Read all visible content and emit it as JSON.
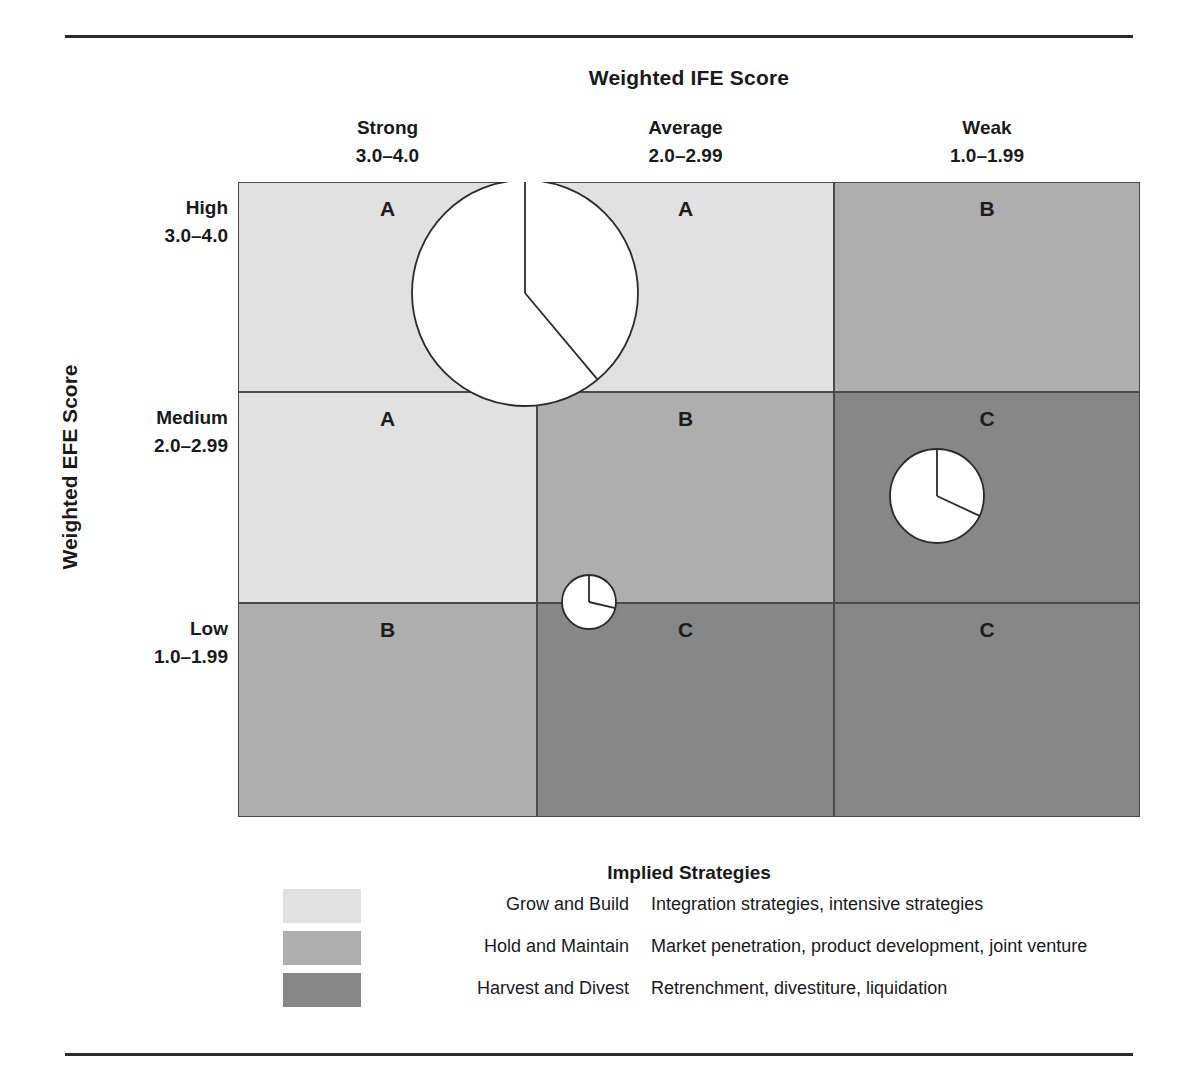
{
  "figure": {
    "x_axis_title": "Weighted IFE Score",
    "y_axis_title": "Weighted EFE Score"
  },
  "columns": [
    {
      "label": "Strong",
      "range": "3.0–4.0"
    },
    {
      "label": "Average",
      "range": "2.0–2.99"
    },
    {
      "label": "Weak",
      "range": "1.0–1.99"
    }
  ],
  "rows": [
    {
      "label": "High",
      "range": "3.0–4.0"
    },
    {
      "label": "Medium",
      "range": "2.0–2.99"
    },
    {
      "label": "Low",
      "range": "1.0–1.99"
    }
  ],
  "colors": {
    "grow_and_build": "#e1e1e1",
    "hold_and_maintain": "#aeaeae",
    "harvest_and_divest": "#878787",
    "border": "#4a4a4a",
    "rule": "#2b2b2b",
    "pie_fill": "#ffffff",
    "pie_stroke": "#2b2b2b"
  },
  "legend": {
    "title": "Implied Strategies",
    "items": [
      {
        "name": "Grow and Build",
        "description": "Integration strategies, intensive strategies",
        "color": "#e1e1e1"
      },
      {
        "name": "Hold and Maintain",
        "description": "Market penetration, product development, joint venture",
        "color": "#aeaeae"
      },
      {
        "name": "Harvest and Divest",
        "description": "Retrenchment, divestiture, liquidation",
        "color": "#878787"
      }
    ]
  },
  "chart_data": {
    "type": "table",
    "xlabel": "Weighted IFE Score",
    "ylabel": "Weighted EFE Score",
    "x_categories": [
      "Strong 3.0–4.0",
      "Average 2.0–2.99",
      "Weak 1.0–1.99"
    ],
    "y_categories": [
      "High 3.0–4.0",
      "Medium 2.0–2.99",
      "Low 1.0–1.99"
    ],
    "grid": true,
    "legend_position": "bottom",
    "cells": [
      {
        "row": 0,
        "col": 0,
        "letter": "A",
        "region": "Grow and Build",
        "color": "#e1e1e1"
      },
      {
        "row": 0,
        "col": 1,
        "letter": "A",
        "region": "Grow and Build",
        "color": "#e1e1e1"
      },
      {
        "row": 0,
        "col": 2,
        "letter": "B",
        "region": "Hold and Maintain",
        "color": "#aeaeae"
      },
      {
        "row": 1,
        "col": 0,
        "letter": "A",
        "region": "Grow and Build",
        "color": "#e1e1e1"
      },
      {
        "row": 1,
        "col": 1,
        "letter": "B",
        "region": "Hold and Maintain",
        "color": "#aeaeae"
      },
      {
        "row": 1,
        "col": 2,
        "letter": "C",
        "region": "Harvest and Divest",
        "color": "#878787"
      },
      {
        "row": 2,
        "col": 0,
        "letter": "B",
        "region": "Hold and Maintain",
        "color": "#aeaeae"
      },
      {
        "row": 2,
        "col": 1,
        "letter": "C",
        "region": "Harvest and Divest",
        "color": "#878787"
      },
      {
        "row": 2,
        "col": 2,
        "letter": "C",
        "region": "Harvest and Divest",
        "color": "#878787"
      }
    ],
    "divisions": [
      {
        "id": "division-large",
        "cx": 287,
        "cy": 111,
        "r": 113,
        "slice_start_deg": 0,
        "slice_end_deg": 140
      },
      {
        "id": "division-medium",
        "cx": 699,
        "cy": 314,
        "r": 47,
        "slice_start_deg": 0,
        "slice_end_deg": 115
      },
      {
        "id": "division-small",
        "cx": 351,
        "cy": 420,
        "r": 27,
        "slice_start_deg": 0,
        "slice_end_deg": 103
      }
    ]
  }
}
